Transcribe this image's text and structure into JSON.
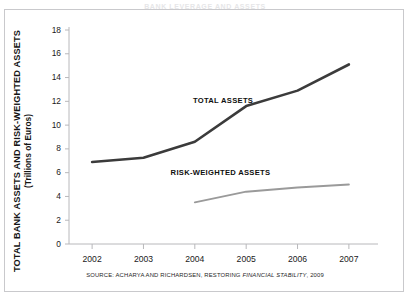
{
  "figure": {
    "top_clipped_heading": "BANK LEVERAGE AND ASSETS",
    "source_prefix": "SOURCE: ACHARYA AND RICHARDSEN,",
    "source_title_roman": "RESTORING",
    "source_title_italic": "FINANCIAL STABILITY",
    "source_year": ", 2009"
  },
  "chart_data": {
    "type": "line",
    "title": "",
    "xlabel": "",
    "ylabel": "TOTAL BANK ASSETS AND RISK-WEIGHTED ASSETS",
    "ylabel_units": "(Trillions of Euros)",
    "x": [
      2002,
      2003,
      2004,
      2005,
      2006,
      2007
    ],
    "xtick_labels": [
      "2002",
      "2003",
      "2004",
      "2005",
      "2006",
      "2007"
    ],
    "ytick_labels": [
      "0",
      "2",
      "4",
      "6",
      "8",
      "10",
      "12",
      "14",
      "16",
      "18"
    ],
    "yticks": [
      0,
      2,
      4,
      6,
      8,
      10,
      12,
      14,
      16,
      18
    ],
    "ylim": [
      0,
      18
    ],
    "xlim": [
      2001.55,
      2007.45
    ],
    "grid": false,
    "legend_position": "inline-annotation",
    "series": [
      {
        "name": "TOTAL ASSETS",
        "color": "#3b3b3b",
        "width": 2.6,
        "x": [
          2002,
          2003,
          2004,
          2005,
          2006,
          2007
        ],
        "values": [
          6.9,
          7.25,
          8.6,
          11.6,
          12.9,
          15.1
        ],
        "label_x": 2004.55,
        "label_y": 12.1
      },
      {
        "name": "RISK-WEIGHTED ASSETS",
        "color": "#9a9a9a",
        "width": 1.9,
        "x": [
          2004,
          2005,
          2006,
          2007
        ],
        "values": [
          3.5,
          4.4,
          4.75,
          5.0
        ],
        "label_x": 2004.5,
        "label_y": 6.05
      }
    ]
  }
}
